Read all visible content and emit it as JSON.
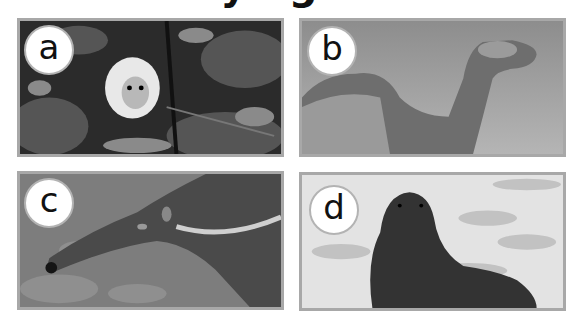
{
  "heading": {
    "text": "Identifying animals"
  },
  "panels": [
    {
      "label": "a",
      "subject": "white-faced monkey in foliage"
    },
    {
      "label": "b",
      "subject": "camel"
    },
    {
      "label": "c",
      "subject": "giant anteater"
    },
    {
      "label": "d",
      "subject": "fur seal"
    }
  ],
  "colors": {
    "border": "#a8a8a8",
    "badge_ring": "#b3b3b3",
    "text": "#111111"
  }
}
